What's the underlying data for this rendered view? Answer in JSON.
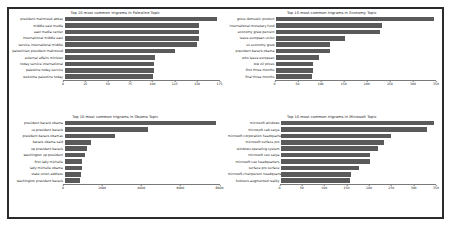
{
  "figure": {
    "background": "#ffffff",
    "frame_color": "#2b2b2b",
    "bar_color": "#5a5a5a"
  },
  "chart_data": [
    {
      "type": "bar",
      "orientation": "horizontal",
      "title": "Top 10 most common trigrams in Palestine Topic",
      "xlabel": "",
      "ylabel": "",
      "grid": false,
      "legend": "none",
      "xlim": [
        0,
        175
      ],
      "xticks": [
        0,
        25,
        50,
        75,
        100,
        125,
        150,
        175
      ],
      "categories": [
        "president mahmoud abbas",
        "middle east media",
        "east media center",
        "international middle east",
        "service international middle",
        "palestinian president mahmoud",
        "external affairs minister",
        "today service international",
        "palestine today service",
        "welcome palestine today"
      ],
      "values": [
        172,
        152,
        152,
        152,
        150,
        125,
        102,
        101,
        101,
        100
      ]
    },
    {
      "type": "bar",
      "orientation": "horizontal",
      "title": "Top 10 most common trigrams in Economy Topic",
      "xlabel": "",
      "ylabel": "",
      "grid": false,
      "legend": "none",
      "xlim": [
        0,
        350
      ],
      "xticks": [
        0,
        50,
        100,
        150,
        200,
        250,
        300,
        350
      ],
      "categories": [
        "gross domestic product",
        "international monetary fund",
        "economy grew percent",
        "leave european union",
        "us economy grew",
        "president barack obama",
        "who leave european",
        "low oil prices",
        "first three months",
        "final three months"
      ],
      "values": [
        345,
        232,
        228,
        150,
        118,
        118,
        95,
        82,
        80,
        78
      ]
    },
    {
      "type": "bar",
      "orientation": "horizontal",
      "title": "Top 10 most common trigrams in Obama Topic",
      "xlabel": "",
      "ylabel": "",
      "grid": false,
      "legend": "none",
      "xlim": [
        0,
        8000
      ],
      "xticks": [
        0,
        2000,
        4000,
        6000,
        8000
      ],
      "categories": [
        "president barack obama",
        "us president barack",
        "president barack obamas",
        "barack obama said",
        "up president barack",
        "washington up president",
        "first lady michelle",
        "lady michelle obama",
        "state union address",
        "washington president barack"
      ],
      "values": [
        7800,
        4300,
        2600,
        1350,
        1150,
        1050,
        900,
        880,
        850,
        800
      ]
    },
    {
      "type": "bar",
      "orientation": "horizontal",
      "title": "Top 10 most common trigrams in Microsoft Topic",
      "xlabel": "",
      "ylabel": "",
      "grid": false,
      "legend": "none",
      "xlim": [
        0,
        350
      ],
      "xticks": [
        0,
        50,
        100,
        150,
        200,
        250,
        300,
        350
      ],
      "categories": [
        "microsoft windows",
        "microsoft cab satya",
        "microsoft corporation headquarters",
        "microsoft surface pro",
        "windows operating system",
        "microsoft ceo satya",
        "microsoft ceo headquarters",
        "surface pro surface",
        "microsoft chairperson headquarters",
        "hololens augmented reality"
      ],
      "values": [
        345,
        330,
        248,
        232,
        218,
        202,
        200,
        175,
        158,
        155
      ]
    }
  ]
}
